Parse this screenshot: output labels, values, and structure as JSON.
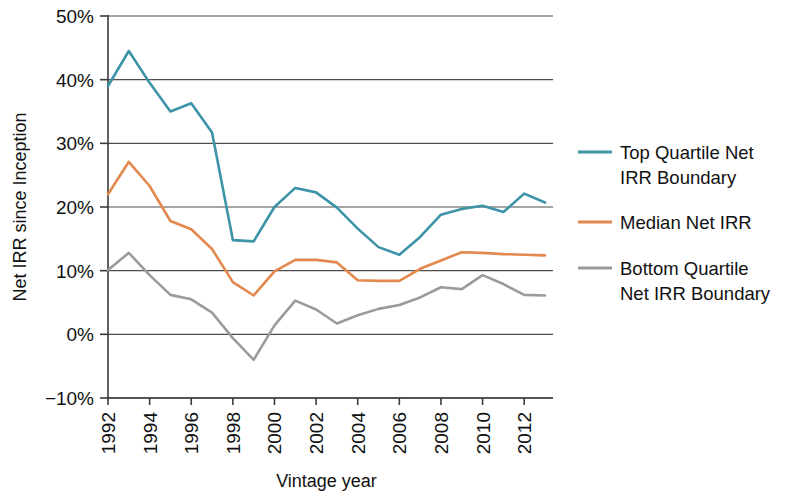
{
  "chart_data": {
    "type": "line",
    "title": "",
    "xlabel": "Vintage year",
    "ylabel": "Net IRR since Inception",
    "x": [
      1992,
      1993,
      1994,
      1995,
      1996,
      1997,
      1998,
      1999,
      2000,
      2001,
      2002,
      2003,
      2004,
      2005,
      2006,
      2007,
      2008,
      2009,
      2010,
      2011,
      2012,
      2013
    ],
    "xlim": [
      1992,
      2013
    ],
    "ylim": [
      -10,
      50
    ],
    "ytick_values": [
      -10,
      0,
      10,
      20,
      30,
      40,
      50
    ],
    "ytick_labels": [
      "−10%",
      "0%",
      "10%",
      "20%",
      "30%",
      "40%",
      "50%"
    ],
    "xtick_values": [
      1992,
      1994,
      1996,
      1998,
      2000,
      2002,
      2004,
      2006,
      2008,
      2010,
      2012
    ],
    "xtick_labels": [
      "1992",
      "1994",
      "1996",
      "1998",
      "2000",
      "2002",
      "2004",
      "2006",
      "2008",
      "2010",
      "2012"
    ],
    "grid": "horizontal",
    "legend_position": "right",
    "series": [
      {
        "name": "Top Quartile Net IRR Boundary",
        "color": "#3d93a8",
        "values": [
          39.0,
          44.5,
          39.5,
          35.0,
          36.3,
          31.7,
          14.8,
          14.6,
          20.0,
          23.0,
          22.3,
          19.9,
          16.6,
          13.7,
          12.5,
          15.3,
          18.8,
          19.7,
          20.2,
          19.2,
          22.1,
          20.7
        ]
      },
      {
        "name": "Median Net IRR",
        "color": "#e3884e",
        "values": [
          22.0,
          27.1,
          23.3,
          17.8,
          16.5,
          13.4,
          8.2,
          6.1,
          9.9,
          11.7,
          11.7,
          11.3,
          8.5,
          8.4,
          8.4,
          10.3,
          11.6,
          12.9,
          12.8,
          12.6,
          12.5,
          12.4
        ]
      },
      {
        "name": "Bottom Quartile Net IRR Boundary",
        "color": "#9b9b9b",
        "values": [
          10.1,
          12.8,
          9.3,
          6.2,
          5.5,
          3.4,
          -0.6,
          -4.0,
          1.4,
          5.3,
          3.9,
          1.7,
          3.0,
          4.0,
          4.6,
          5.8,
          7.4,
          7.1,
          9.3,
          7.9,
          6.2,
          6.1
        ]
      }
    ]
  },
  "legend": {
    "entries": [
      {
        "label_line1": "Top Quartile Net",
        "label_line2": "IRR Boundary",
        "color": "#3d93a8"
      },
      {
        "label_line1": "Median Net IRR",
        "label_line2": "",
        "color": "#e3884e"
      },
      {
        "label_line1": "Bottom Quartile",
        "label_line2": "Net IRR Boundary",
        "color": "#9b9b9b"
      }
    ]
  },
  "axes": {
    "y_title": "Net IRR since Inception",
    "x_title": "Vintage year"
  }
}
